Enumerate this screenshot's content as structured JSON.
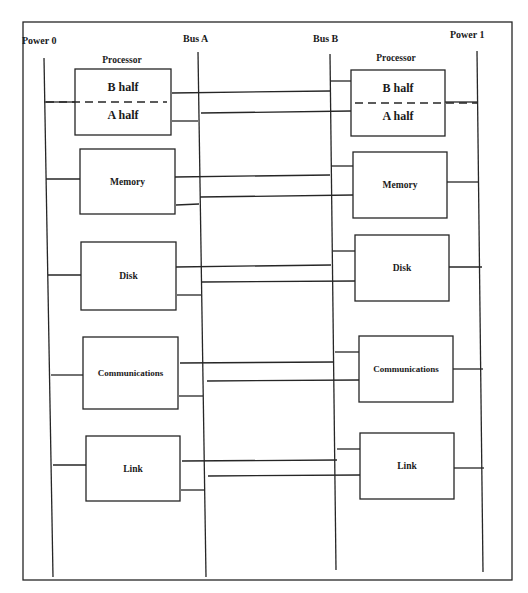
{
  "diagram": {
    "frame": {
      "x1": 23,
      "y1": 22,
      "x2": 512,
      "y2": 580
    },
    "colors": {
      "line": "#262626",
      "text": "#1a1a1a",
      "background": "#ffffff"
    },
    "rails": [
      {
        "id": "power0",
        "label": "Power 0",
        "x": 44,
        "y_top": 58,
        "y_bottom": 577,
        "label_x": 22,
        "label_y": 44
      },
      {
        "id": "busA",
        "label": "Bus A",
        "x": 198,
        "y_top": 52,
        "y_bottom": 577,
        "label_x": 183,
        "label_y": 42
      },
      {
        "id": "busB",
        "label": "Bus B",
        "x": 330,
        "y_top": 54,
        "y_bottom": 570,
        "label_x": 313,
        "label_y": 42
      },
      {
        "id": "power1",
        "label": "Power 1",
        "x": 477,
        "y_top": 51,
        "y_bottom": 572,
        "label_x": 450,
        "label_y": 38
      }
    ],
    "modules": [
      {
        "name": "Processor",
        "header_label": "Processor",
        "split": true,
        "top_half": "B half",
        "bottom_half": "A half",
        "left": {
          "x": 75,
          "y": 69,
          "w": 96,
          "h": 66,
          "header_x": 122,
          "header_y": 63
        },
        "right": {
          "x": 351,
          "y": 70,
          "w": 94,
          "h": 66,
          "header_x": 396,
          "header_y": 61
        }
      },
      {
        "name": "Memory",
        "split": false,
        "left": {
          "x": 80,
          "y": 149,
          "w": 95,
          "h": 65
        },
        "right": {
          "x": 353,
          "y": 152,
          "w": 94,
          "h": 66
        }
      },
      {
        "name": "Disk",
        "split": false,
        "left": {
          "x": 81,
          "y": 242,
          "w": 95,
          "h": 68
        },
        "right": {
          "x": 355,
          "y": 235,
          "w": 94,
          "h": 66
        }
      },
      {
        "name": "Communications",
        "split": false,
        "left": {
          "x": 83,
          "y": 337,
          "w": 95,
          "h": 72
        },
        "right": {
          "x": 359,
          "y": 336,
          "w": 94,
          "h": 66
        }
      },
      {
        "name": "Link",
        "split": false,
        "left": {
          "x": 86,
          "y": 436,
          "w": 94,
          "h": 65
        },
        "right": {
          "x": 360,
          "y": 433,
          "w": 94,
          "h": 66
        }
      }
    ],
    "wires": [
      {
        "from": "power0",
        "x1": 44,
        "y1": 102,
        "x2": 75,
        "y2": 102
      },
      {
        "from": "proc-left-B",
        "x1": 172,
        "y1": 93,
        "x2": 330,
        "y2": 91
      },
      {
        "from": "proc-left-A",
        "x1": 172,
        "y1": 121,
        "x2": 198,
        "y2": 121
      },
      {
        "from": "busA-proc-right",
        "x1": 201,
        "y1": 113,
        "x2": 351,
        "y2": 111
      },
      {
        "from": "busB-proc-right",
        "x1": 330,
        "y1": 81,
        "x2": 351,
        "y2": 81
      },
      {
        "from": "proc-right-power1",
        "x1": 445,
        "y1": 102,
        "x2": 477,
        "y2": 102
      },
      {
        "from": "power0-mem",
        "x1": 46,
        "y1": 179,
        "x2": 80,
        "y2": 179
      },
      {
        "from": "mem-left-B",
        "x1": 175,
        "y1": 177,
        "x2": 330,
        "y2": 175
      },
      {
        "from": "mem-left-A",
        "x1": 176,
        "y1": 205,
        "x2": 199,
        "y2": 204
      },
      {
        "from": "busA-mem-right",
        "x1": 200,
        "y1": 197,
        "x2": 353,
        "y2": 195
      },
      {
        "from": "busB-mem-right",
        "x1": 331,
        "y1": 166,
        "x2": 353,
        "y2": 166
      },
      {
        "from": "mem-right-power1",
        "x1": 447,
        "y1": 182,
        "x2": 478,
        "y2": 182
      },
      {
        "from": "power0-disk",
        "x1": 48,
        "y1": 275,
        "x2": 81,
        "y2": 275
      },
      {
        "from": "disk-left-B",
        "x1": 176,
        "y1": 267,
        "x2": 331,
        "y2": 265
      },
      {
        "from": "disk-left-A",
        "x1": 177,
        "y1": 295,
        "x2": 201,
        "y2": 295
      },
      {
        "from": "busA-disk-right",
        "x1": 202,
        "y1": 282,
        "x2": 355,
        "y2": 281
      },
      {
        "from": "busB-disk-right",
        "x1": 333,
        "y1": 251,
        "x2": 355,
        "y2": 251
      },
      {
        "from": "disk-right-power1",
        "x1": 449,
        "y1": 267,
        "x2": 482,
        "y2": 267
      },
      {
        "from": "power0-comm",
        "x1": 51,
        "y1": 375,
        "x2": 83,
        "y2": 375
      },
      {
        "from": "comm-left-B",
        "x1": 180,
        "y1": 363,
        "x2": 334,
        "y2": 362
      },
      {
        "from": "comm-left-A",
        "x1": 179,
        "y1": 396,
        "x2": 203,
        "y2": 396
      },
      {
        "from": "busA-comm-right",
        "x1": 207,
        "y1": 381,
        "x2": 359,
        "y2": 380
      },
      {
        "from": "busB-comm-right",
        "x1": 335,
        "y1": 352,
        "x2": 359,
        "y2": 352
      },
      {
        "from": "comm-right-power1",
        "x1": 453,
        "y1": 369,
        "x2": 483,
        "y2": 369
      },
      {
        "from": "power0-link",
        "x1": 53,
        "y1": 465,
        "x2": 86,
        "y2": 465
      },
      {
        "from": "link-left-B",
        "x1": 182,
        "y1": 461,
        "x2": 337,
        "y2": 460
      },
      {
        "from": "link-left-A",
        "x1": 181,
        "y1": 490,
        "x2": 205,
        "y2": 490
      },
      {
        "from": "busA-link-right",
        "x1": 208,
        "y1": 476,
        "x2": 360,
        "y2": 475
      },
      {
        "from": "busB-link-right",
        "x1": 337,
        "y1": 449,
        "x2": 360,
        "y2": 449
      },
      {
        "from": "link-right-power1",
        "x1": 454,
        "y1": 468,
        "x2": 484,
        "y2": 468
      }
    ]
  }
}
